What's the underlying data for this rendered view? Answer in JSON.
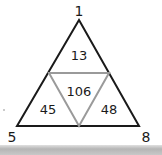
{
  "diagram": {
    "type": "number-triangle",
    "corners": {
      "top": "1",
      "bottom_left": "5",
      "bottom_right": "8"
    },
    "regions": {
      "top": "13",
      "center": "106",
      "left": "45",
      "right": "48"
    },
    "colors": {
      "outer_triangle": "#1a1a1a",
      "inner_triangle": "#9a9a9a",
      "text": "#1a1a1a"
    }
  }
}
